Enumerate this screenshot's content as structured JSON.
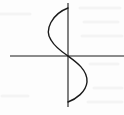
{
  "diagram": {
    "type": "s-curve-on-axes",
    "colors": {
      "background": "#fdfdfd",
      "stroke": "#1a1a1a",
      "bleed_through": "#ececec"
    },
    "axes": {
      "horizontal": {
        "x1": 10,
        "y1": 56,
        "x2": 124,
        "y2": 56
      },
      "vertical": {
        "x1": 68,
        "y1": 3,
        "x2": 68,
        "y2": 107
      }
    },
    "curve": {
      "start": [
        68,
        8
      ],
      "upper_lobe_extreme": [
        49,
        30
      ],
      "origin_crossing": [
        68,
        56
      ],
      "lower_lobe_extreme": [
        87,
        80
      ],
      "end": [
        68,
        102
      ]
    }
  }
}
